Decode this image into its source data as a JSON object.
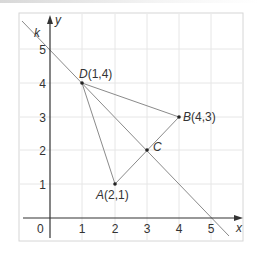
{
  "figure": {
    "axes": {
      "x_label": "x",
      "y_label": "y",
      "origin_label": "0",
      "x_ticks": [
        "1",
        "2",
        "3",
        "4",
        "5"
      ],
      "y_ticks": [
        "1",
        "2",
        "3",
        "4",
        "5"
      ]
    },
    "line": {
      "name": "k",
      "equation": "y = -x + 5"
    },
    "points": [
      {
        "name": "A",
        "label_name": "A",
        "label_coords": "(2,1)",
        "x": 2,
        "y": 1
      },
      {
        "name": "B",
        "label_name": "B",
        "label_coords": "(4,3)",
        "x": 4,
        "y": 3
      },
      {
        "name": "C",
        "label_name": "C",
        "label_coords": "",
        "x": 3,
        "y": 2
      },
      {
        "name": "D",
        "label_name": "D",
        "label_coords": "(1,4)",
        "x": 1,
        "y": 4
      }
    ],
    "segments": [
      [
        "D",
        "A"
      ],
      [
        "A",
        "B"
      ],
      [
        "D",
        "B"
      ]
    ],
    "colors": {
      "grid": "#e4e4e4",
      "frame": "#d6d6d6",
      "line": "#8a8a8a",
      "axis": "#333333",
      "point": "#222222"
    }
  }
}
